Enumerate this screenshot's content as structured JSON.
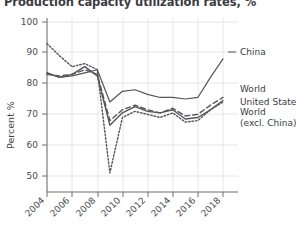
{
  "chart_data": {
    "type": "line",
    "title": "Production capacity utilization rates, %",
    "xlabel": "",
    "ylabel": "Percent %",
    "x": [
      2004,
      2005,
      2006,
      2007,
      2008,
      2009,
      2010,
      2011,
      2012,
      2013,
      2014,
      2015,
      2016,
      2017,
      2018
    ],
    "xticks": [
      "2004",
      "2006",
      "2008",
      "2010",
      "2012",
      "2014",
      "2016",
      "2018"
    ],
    "yticks": [
      "50",
      "60",
      "70",
      "80",
      "90",
      "100"
    ],
    "xlim": [
      2004,
      2018
    ],
    "ylim": [
      45,
      100
    ],
    "grid": true,
    "legend_position": "right-inline",
    "series": [
      {
        "name": "China",
        "style": "solid",
        "color": "#55555a",
        "values": [
          83.5,
          82.0,
          82.5,
          83.5,
          84.5,
          74.0,
          77.5,
          78.0,
          76.5,
          75.5,
          75.5,
          75.0,
          75.5,
          82.0,
          88.0
        ]
      },
      {
        "name": "World",
        "style": "dashed",
        "color": "#55555a",
        "values": [
          83.0,
          82.5,
          83.0,
          84.5,
          83.0,
          68.0,
          71.5,
          73.0,
          71.5,
          70.5,
          72.0,
          69.5,
          70.0,
          73.0,
          75.5
        ]
      },
      {
        "name": "United States",
        "style": "solid-thin",
        "color": "#55555a",
        "values": [
          83.5,
          82.0,
          83.0,
          85.5,
          82.5,
          66.5,
          70.5,
          72.5,
          71.0,
          70.5,
          71.5,
          68.5,
          69.0,
          71.5,
          74.5
        ]
      },
      {
        "name": "World (excl. China)",
        "style": "dotted",
        "color": "#55555a",
        "values": [
          93.0,
          89.0,
          85.5,
          86.5,
          84.5,
          51.0,
          69.0,
          71.0,
          70.0,
          69.0,
          70.5,
          67.5,
          68.0,
          71.5,
          74.0
        ]
      }
    ],
    "legend_labels": [
      {
        "text": "China",
        "y": 55
      },
      {
        "text": "World",
        "y": 92
      },
      {
        "text": "United States",
        "y": 105
      },
      {
        "text": "World",
        "y": 115
      },
      {
        "text": "(excl. China)",
        "y": 126
      }
    ]
  }
}
